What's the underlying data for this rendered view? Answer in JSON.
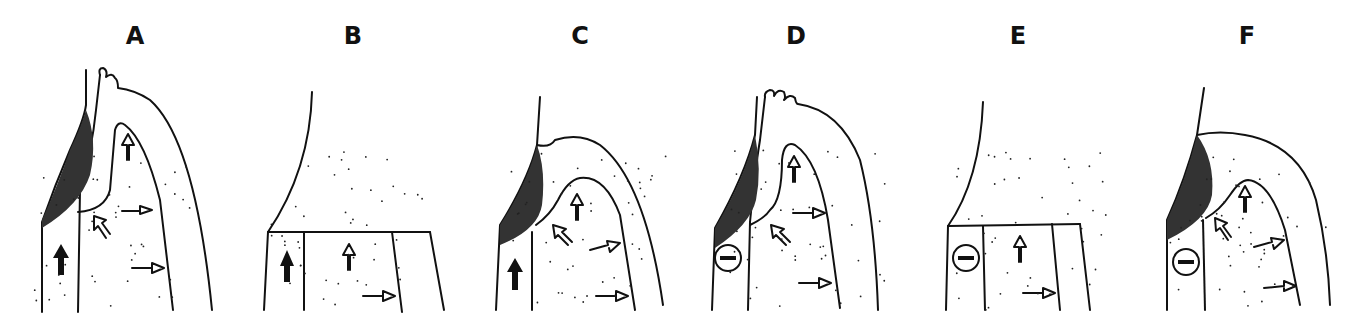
{
  "figure": {
    "panels": [
      {
        "id": "A",
        "label": "A",
        "has_enamel_mass": true,
        "has_minus_marker": false,
        "crest": "papillary"
      },
      {
        "id": "B",
        "label": "B",
        "has_enamel_mass": false,
        "has_minus_marker": false,
        "crest": "flat"
      },
      {
        "id": "C",
        "label": "C",
        "has_enamel_mass": true,
        "has_minus_marker": false,
        "crest": "rounded"
      },
      {
        "id": "D",
        "label": "D",
        "has_enamel_mass": true,
        "has_minus_marker": true,
        "crest": "papillary"
      },
      {
        "id": "E",
        "label": "E",
        "has_enamel_mass": false,
        "has_minus_marker": true,
        "crest": "flat"
      },
      {
        "id": "F",
        "label": "F",
        "has_enamel_mass": true,
        "has_minus_marker": true,
        "crest": "rounded"
      }
    ],
    "minus_symbol": "−",
    "colors": {
      "ink": "#111111",
      "background": "#ffffff"
    }
  }
}
